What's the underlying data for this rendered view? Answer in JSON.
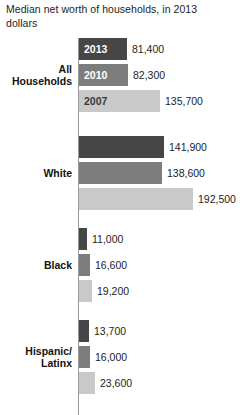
{
  "chart_data": {
    "type": "bar",
    "orientation": "horizontal",
    "title": "Median net worth of households, in 2013 dollars",
    "xlabel": "",
    "ylabel": "",
    "grid": false,
    "legend_position": "none",
    "axis_line": true,
    "xlim": [
      0,
      192500
    ],
    "units": "2013 dollars",
    "categories": [
      "All Households",
      "White",
      "Black",
      "Hispanic/Latinx"
    ],
    "series": [
      {
        "name": "2013",
        "color": "#464646",
        "values": [
          81400,
          141900,
          11000,
          13700
        ]
      },
      {
        "name": "2010",
        "color": "#7d7d7d",
        "values": [
          82300,
          138600,
          16600,
          16000
        ]
      },
      {
        "name": "2007",
        "color": "#c9c9c9",
        "values": [
          135700,
          192500,
          19200,
          23600
        ]
      }
    ]
  },
  "title": {
    "line1": "Median net worth of households, in 2013",
    "line2": "dollars"
  },
  "groups": [
    {
      "label_line1": "All",
      "label_line2": "Households",
      "bars": [
        {
          "year": "2013",
          "value": "81,400",
          "width": 48,
          "shade": "d2013",
          "show_year": true,
          "year_on_light": false
        },
        {
          "year": "2010",
          "value": "82,300",
          "width": 49,
          "shade": "d2010",
          "show_year": true,
          "year_on_light": false
        },
        {
          "year": "2007",
          "value": "135,700",
          "width": 81,
          "shade": "d2007",
          "show_year": true,
          "year_on_light": true
        }
      ]
    },
    {
      "label_line1": "White",
      "label_line2": "",
      "bars": [
        {
          "year": "2013",
          "value": "141,900",
          "width": 85,
          "shade": "d2013",
          "show_year": false,
          "year_on_light": false
        },
        {
          "year": "2010",
          "value": "138,600",
          "width": 83,
          "shade": "d2010",
          "show_year": false,
          "year_on_light": false
        },
        {
          "year": "2007",
          "value": "192,500",
          "width": 114,
          "shade": "d2007",
          "show_year": false,
          "year_on_light": false
        }
      ]
    },
    {
      "label_line1": "Black",
      "label_line2": "",
      "bars": [
        {
          "year": "2013",
          "value": "11,000",
          "width": 8,
          "shade": "d2013",
          "show_year": false,
          "year_on_light": false
        },
        {
          "year": "2010",
          "value": "16,600",
          "width": 11,
          "shade": "d2010",
          "show_year": false,
          "year_on_light": false
        },
        {
          "year": "2007",
          "value": "19,200",
          "width": 13,
          "shade": "d2007",
          "show_year": false,
          "year_on_light": false
        }
      ]
    },
    {
      "label_line1": "Hispanic/",
      "label_line2": "Latinx",
      "bars": [
        {
          "year": "2013",
          "value": "13,700",
          "width": 10,
          "shade": "d2013",
          "show_year": false,
          "year_on_light": false
        },
        {
          "year": "2010",
          "value": "16,000",
          "width": 11,
          "shade": "d2010",
          "show_year": false,
          "year_on_light": false
        },
        {
          "year": "2007",
          "value": "23,600",
          "width": 16,
          "shade": "d2007",
          "show_year": false,
          "year_on_light": false
        }
      ]
    }
  ],
  "layout": {
    "group_tops": [
      6,
      104,
      196,
      288
    ],
    "bar_height": 22,
    "bar_gap": 4,
    "value_gap": 5
  }
}
